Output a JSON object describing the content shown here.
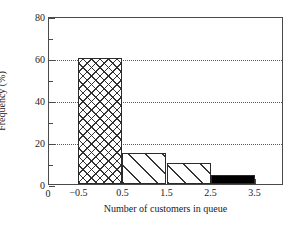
{
  "chart_data": {
    "type": "bar",
    "title": "",
    "subtitle": "",
    "xlabel": "Number of customers in queue",
    "ylabel": "Frequency (%)",
    "categories": [
      "0",
      "1",
      "2",
      "3"
    ],
    "bin_edges": [
      -0.5,
      0.5,
      1.5,
      2.5,
      3.5
    ],
    "values": [
      60,
      15,
      10,
      4.5
    ],
    "series": [
      {
        "name": "Frequency",
        "values": [
          60,
          15,
          10,
          4.5
        ]
      }
    ],
    "bars": [
      {
        "label": "0",
        "left": -0.5,
        "right": 0.5,
        "value": 60,
        "fill": "crosshatch"
      },
      {
        "label": "1",
        "left": 0.5,
        "right": 1.5,
        "value": 15,
        "fill": "diagonal"
      },
      {
        "label": "2",
        "left": 1.5,
        "right": 2.5,
        "value": 10,
        "fill": "diagonal"
      },
      {
        "label": "3",
        "left": 2.5,
        "right": 3.5,
        "value": 4.5,
        "fill": "solid-black"
      }
    ],
    "xlim": [
      -1.17,
      4.17
    ],
    "ylim": [
      0,
      80
    ],
    "xticks": [
      -0.5,
      0.5,
      1.5,
      2.5,
      3.5
    ],
    "xtick_labels": [
      "−0.5",
      "0.5",
      "1.5",
      "2.5",
      "3.5"
    ],
    "x_origin_label": "0",
    "yticks": [
      0,
      20,
      40,
      60,
      80
    ],
    "ytick_labels": [
      "0",
      "20",
      "40",
      "60",
      "80"
    ],
    "yticks_minor": [
      10,
      30,
      50,
      70
    ],
    "gridlines_y": [
      20,
      40,
      60
    ],
    "grid": "horizontal-dotted",
    "legend": "none",
    "colors": {
      "axis": "#4a4a4a",
      "text": "#1a1a1a",
      "grid": "#5a5a5a",
      "bar_edge": "#2b2b2b",
      "bar_solid": "#000000",
      "background": "#ffffff"
    }
  }
}
